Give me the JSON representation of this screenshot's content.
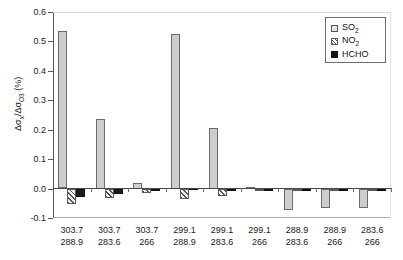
{
  "chart_data": {
    "type": "bar",
    "title": "",
    "xlabel": "",
    "ylabel": "Δσx/ΔσO3 (%)",
    "ylim": [
      -0.1,
      0.6
    ],
    "yticks": [
      0.6,
      0.5,
      0.4,
      0.3,
      0.2,
      0.1,
      0.0,
      -0.1
    ],
    "ytick_labels": [
      "0.6",
      "0.5",
      "0.4",
      "0.3",
      "0.2",
      "0.1",
      "0.0",
      "-0.1"
    ],
    "grid": false,
    "legend_position": "top-right",
    "categories": [
      "303.7 / 288.9",
      "303.7 / 283.6",
      "303.7 / 266",
      "299.1 / 288.9",
      "299.1 / 283.6",
      "299.1 / 266",
      "288.9 / 283.6",
      "288.9 / 266",
      "283.6 / 266"
    ],
    "category_lines": [
      [
        "303.7",
        "288.9"
      ],
      [
        "303.7",
        "283.6"
      ],
      [
        "303.7",
        "266"
      ],
      [
        "299.1",
        "288.9"
      ],
      [
        "299.1",
        "283.6"
      ],
      [
        "299.1",
        "266"
      ],
      [
        "288.9",
        "283.6"
      ],
      [
        "288.9",
        "266"
      ],
      [
        "283.6",
        "266"
      ]
    ],
    "series": [
      {
        "name": "SO2",
        "label": "SO",
        "sub": "2",
        "color": "#cdcdcd",
        "fill": "solid-light-gray",
        "values": [
          0.534,
          0.235,
          0.02,
          0.525,
          0.207,
          0.007,
          -0.072,
          -0.067,
          -0.067
        ]
      },
      {
        "name": "NO2",
        "label": "NO",
        "sub": "2",
        "color": "#f2f2f2",
        "fill": "diagonal-hatch",
        "values": [
          -0.054,
          -0.033,
          -0.016,
          -0.034,
          -0.024,
          -0.008,
          -0.008,
          -0.003,
          -0.003
        ]
      },
      {
        "name": "HCHO",
        "label": "HCHO",
        "sub": "",
        "color": "#1c1c1c",
        "fill": "solid-black",
        "values": [
          -0.03,
          -0.018,
          -0.009,
          0.003,
          -0.002,
          -0.006,
          -0.005,
          -0.002,
          -0.003
        ]
      }
    ]
  },
  "legend": {
    "items": [
      {
        "label": "SO",
        "sub": "2",
        "swatch": "so2-swatch"
      },
      {
        "label": "NO",
        "sub": "2",
        "swatch": "no2-swatch"
      },
      {
        "label": "HCHO",
        "sub": "",
        "swatch": "hcho-swatch"
      }
    ]
  }
}
